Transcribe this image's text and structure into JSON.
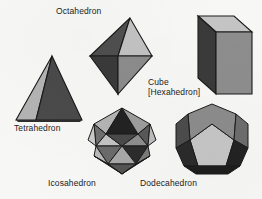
{
  "figure": {
    "background_color": "#f7f7f5",
    "ink_color": "#1c1c1c"
  },
  "palette": {
    "light": "#c9c9c9",
    "light_alt": "#bdbdbd",
    "mid": "#8f8f8f",
    "mid_dark": "#6e6e6e",
    "dark": "#3d3d3d",
    "darkest": "#242424",
    "edge": "#1a1a1a"
  },
  "solids": [
    {
      "id": "tetrahedron",
      "name": "Tetrahedron",
      "faces": 4,
      "face_shape": "triangle",
      "label": {
        "lines": [
          "Tetrahedron"
        ],
        "x": 14,
        "y": 123
      },
      "position": {
        "x": 12,
        "y": 54,
        "width": 74,
        "height": 70
      }
    },
    {
      "id": "octahedron",
      "name": "Octahedron",
      "faces": 8,
      "face_shape": "triangle",
      "label": {
        "lines": [
          "Octahedron"
        ],
        "x": 56,
        "y": 6
      },
      "position": {
        "x": 88,
        "y": 16,
        "width": 66,
        "height": 80
      }
    },
    {
      "id": "cube",
      "name": "Cube",
      "alt_name": "[Hexahedron]",
      "faces": 6,
      "face_shape": "square",
      "label": {
        "lines": [
          "Cube",
          "[Hexahedron]"
        ],
        "x": 148,
        "y": 78
      },
      "position": {
        "x": 176,
        "y": 14,
        "width": 78,
        "height": 82
      }
    },
    {
      "id": "icosahedron",
      "name": "Icosahedron",
      "faces": 20,
      "face_shape": "triangle",
      "label": {
        "lines": [
          "Icosahedron"
        ],
        "x": 48,
        "y": 178
      },
      "position": {
        "x": 84,
        "y": 106,
        "width": 76,
        "height": 72
      }
    },
    {
      "id": "dodecahedron",
      "name": "Dodecahedron",
      "faces": 12,
      "face_shape": "pentagon",
      "label": {
        "lines": [
          "Dodecahedron"
        ],
        "x": 140,
        "y": 178
      },
      "position": {
        "x": 172,
        "y": 100,
        "width": 80,
        "height": 78
      }
    }
  ]
}
